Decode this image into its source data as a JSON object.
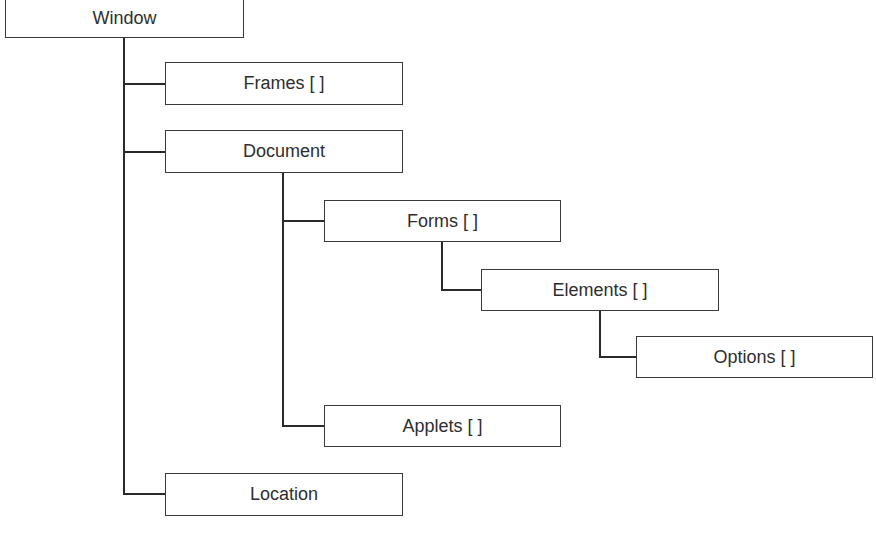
{
  "diagram": {
    "title": "",
    "nodes": [
      {
        "id": "window",
        "label": "Window",
        "x": 5,
        "y": -2,
        "w": 239,
        "h": 40
      },
      {
        "id": "frames",
        "label": "Frames [ ]",
        "x": 165,
        "y": 62,
        "w": 238,
        "h": 43
      },
      {
        "id": "document",
        "label": "Document",
        "x": 165,
        "y": 130,
        "w": 238,
        "h": 43
      },
      {
        "id": "forms",
        "label": "Forms [ ]",
        "x": 324,
        "y": 200,
        "w": 237,
        "h": 42
      },
      {
        "id": "elements",
        "label": "Elements [ ]",
        "x": 481,
        "y": 269,
        "w": 238,
        "h": 42
      },
      {
        "id": "options",
        "label": "Options [ ]",
        "x": 636,
        "y": 336,
        "w": 237,
        "h": 42
      },
      {
        "id": "applets",
        "label": "Applets [ ]",
        "x": 324,
        "y": 405,
        "w": 237,
        "h": 42
      },
      {
        "id": "location",
        "label": "Location",
        "x": 165,
        "y": 473,
        "w": 238,
        "h": 43
      }
    ],
    "edges": [
      {
        "from": "window",
        "to": "frames"
      },
      {
        "from": "window",
        "to": "document"
      },
      {
        "from": "window",
        "to": "location"
      },
      {
        "from": "document",
        "to": "forms"
      },
      {
        "from": "document",
        "to": "applets"
      },
      {
        "from": "forms",
        "to": "elements"
      },
      {
        "from": "elements",
        "to": "options"
      }
    ],
    "colors": {
      "line": "#2a2a2a",
      "border": "#3a3a3a",
      "background": "#ffffff"
    }
  }
}
